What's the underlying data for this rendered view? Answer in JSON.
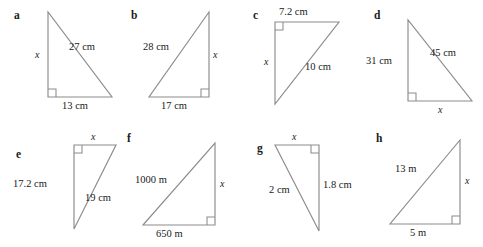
{
  "page": {
    "background_color": "#ffffff",
    "line_color": "#8c8c8c",
    "text_color": "#1a1a1a"
  },
  "figures": [
    {
      "key": "a",
      "label": "a",
      "right_angle": "bottom-left",
      "sides": {
        "vertical": "x",
        "horizontal": "13 cm",
        "hypotenuse": "27 cm"
      }
    },
    {
      "key": "b",
      "label": "b",
      "right_angle": "bottom-right",
      "sides": {
        "vertical": "x",
        "horizontal": "17 cm",
        "hypotenuse": "28 cm"
      }
    },
    {
      "key": "c",
      "label": "c",
      "right_angle": "top-left",
      "sides": {
        "vertical": "x",
        "horizontal": "7.2 cm",
        "hypotenuse": "10 cm"
      }
    },
    {
      "key": "d",
      "label": "d",
      "right_angle": "bottom-left",
      "sides": {
        "vertical": "31 cm",
        "horizontal": "x",
        "hypotenuse": "45 cm"
      }
    },
    {
      "key": "e",
      "label": "e",
      "right_angle": "top-left",
      "sides": {
        "vertical": "17.2 cm",
        "horizontal": "x",
        "hypotenuse": "19 cm"
      }
    },
    {
      "key": "f",
      "label": "f",
      "right_angle": "bottom-right",
      "sides": {
        "vertical": "x",
        "horizontal": "650 m",
        "hypotenuse": "1000 m"
      }
    },
    {
      "key": "g",
      "label": "g",
      "right_angle": "top-right",
      "sides": {
        "vertical": "1.8 cm",
        "horizontal": "x",
        "hypotenuse": "2 cm"
      }
    },
    {
      "key": "h",
      "label": "h",
      "right_angle": "bottom-right",
      "sides": {
        "vertical": "x",
        "horizontal": "5 m",
        "hypotenuse": "13 m"
      }
    }
  ]
}
